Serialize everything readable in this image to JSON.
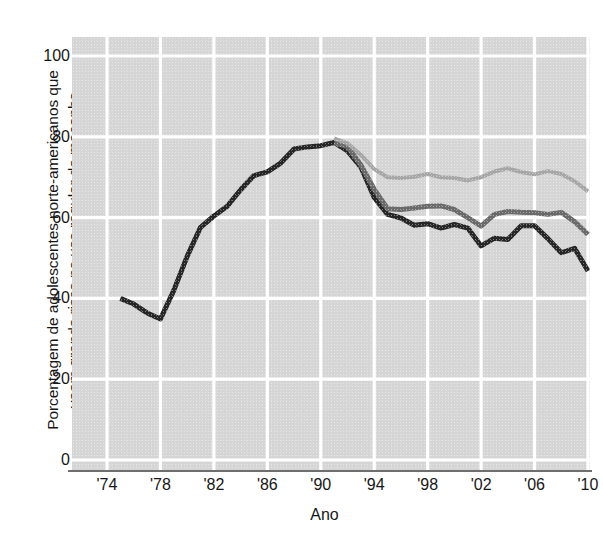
{
  "chart_data": {
    "type": "line",
    "title": "",
    "subtitle": "",
    "xlabel": "Ano",
    "ylabel": "Porcentagem de adolescentes norte-americanos que veem grande risco no uso regular de maconha",
    "ylabel_lines": [
      "Porcentagem de adolescentes norte-americanos que",
      "veem grande risco no uso regular de maconha"
    ],
    "xlim": [
      1974,
      2010
    ],
    "ylim": [
      0,
      100
    ],
    "ytick_values": [
      0,
      20,
      40,
      60,
      80,
      100
    ],
    "ytick_labels": [
      "0",
      "20",
      "40",
      "60",
      "80",
      "100"
    ],
    "xtick_values": [
      1974,
      1978,
      1982,
      1986,
      1990,
      1994,
      1998,
      2002,
      2006,
      2010
    ],
    "xtick_labels": [
      "'74",
      "'78",
      "'82",
      "'86",
      "'90",
      "'94",
      "'98",
      "'02",
      "'06",
      "'10"
    ],
    "grid": true,
    "grid_color": "#ffffff",
    "plot_background": "#d5d5d5",
    "legend": "none",
    "series": [
      {
        "name": "12th grade",
        "color": "#262626",
        "linewidth": 5,
        "x": [
          1975,
          1976,
          1977,
          1978,
          1979,
          1980,
          1981,
          1982,
          1983,
          1984,
          1985,
          1986,
          1987,
          1988,
          1989,
          1990,
          1991,
          1992,
          1993,
          1994,
          1995,
          1996,
          1997,
          1998,
          1999,
          2000,
          2001,
          2002,
          2003,
          2004,
          2005,
          2006,
          2007,
          2008,
          2009,
          2010
        ],
        "values": [
          40.0,
          38.6,
          36.4,
          34.9,
          42.0,
          50.4,
          57.6,
          60.4,
          62.8,
          66.9,
          70.4,
          71.3,
          73.5,
          77.0,
          77.5,
          77.8,
          78.6,
          76.5,
          72.5,
          65.0,
          60.8,
          59.9,
          58.1,
          58.5,
          57.4,
          58.3,
          57.4,
          53.0,
          54.9,
          54.6,
          58.0,
          58.0,
          54.8,
          51.3,
          52.4,
          46.8
        ]
      },
      {
        "name": "10th grade",
        "color": "#6a6a6a",
        "linewidth": 5,
        "x": [
          1991,
          1992,
          1993,
          1994,
          1995,
          1996,
          1997,
          1998,
          1999,
          2000,
          2001,
          2002,
          2003,
          2004,
          2005,
          2006,
          2007,
          2008,
          2009,
          2010
        ],
        "values": [
          78.5,
          77.6,
          73.0,
          67.0,
          62.2,
          62.0,
          62.4,
          62.8,
          62.9,
          62.0,
          60.0,
          57.9,
          60.8,
          61.5,
          61.3,
          61.2,
          60.8,
          61.3,
          59.0,
          55.8
        ]
      },
      {
        "name": "8th grade",
        "color": "#a6a6a6",
        "linewidth": 4,
        "x": [
          1991,
          1992,
          1993,
          1994,
          1995,
          1996,
          1997,
          1998,
          1999,
          2000,
          2001,
          2002,
          2003,
          2004,
          2005,
          2006,
          2007,
          2008,
          2009,
          2010
        ],
        "values": [
          79.6,
          78.4,
          75.5,
          72.0,
          70.0,
          69.8,
          70.1,
          70.8,
          70.0,
          69.8,
          69.2,
          70.0,
          71.4,
          72.2,
          71.3,
          70.7,
          71.5,
          70.8,
          69.0,
          66.5
        ]
      }
    ]
  }
}
